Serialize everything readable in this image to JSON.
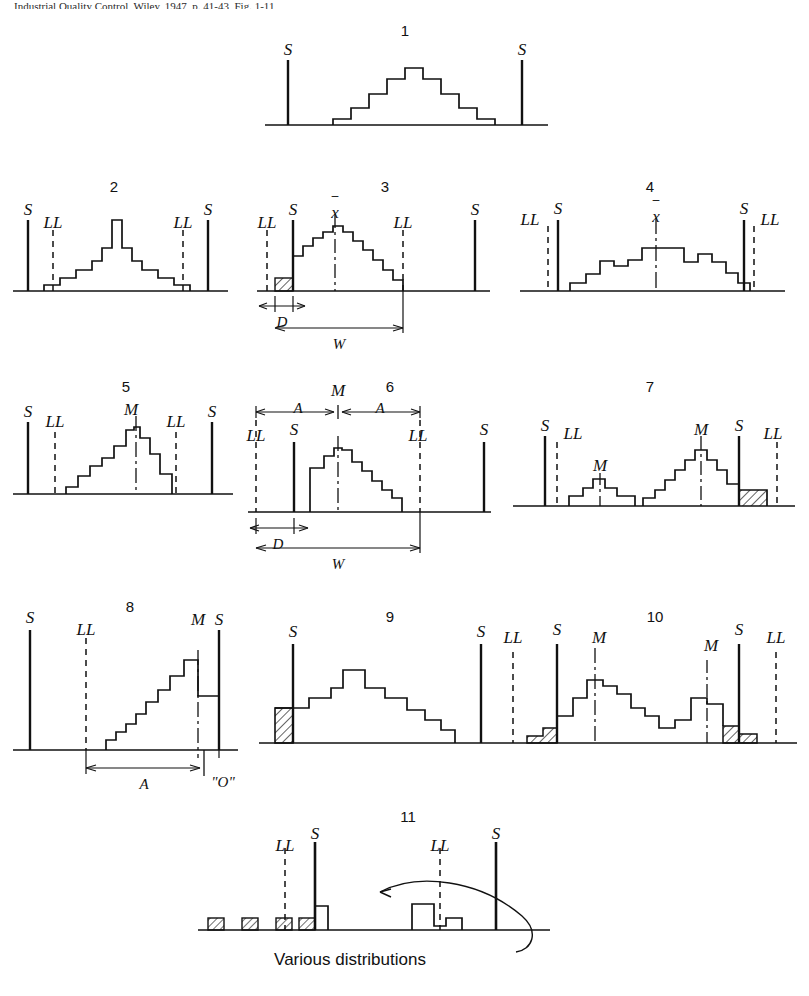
{
  "header": {
    "running_text": "Industrial Quality Control, Wiley, 1947, p. 41-43, Fig. 1-11"
  },
  "caption": {
    "various": "Various distributions"
  },
  "symbols": {
    "spec": "S",
    "limit": "LL",
    "xbarbar": "x",
    "mode": "M",
    "dim_a": "A",
    "dim_d": "D",
    "dim_w": "W",
    "zero": "\"O\""
  },
  "figures": [
    {
      "number": "1",
      "labels": [
        "S",
        "S"
      ],
      "annotations": [],
      "bars": [
        1,
        2,
        3,
        4,
        6,
        7,
        6,
        5,
        4,
        3,
        2,
        1
      ],
      "hatched": [],
      "note": "symmetric bell inside both spec limits"
    },
    {
      "number": "2",
      "labels": [
        "S",
        "LL",
        "LL",
        "S"
      ],
      "annotations": [],
      "bars": [
        1,
        1,
        2,
        3,
        4,
        5,
        9,
        5,
        4,
        3,
        2,
        1,
        1
      ],
      "hatched": [],
      "note": "narrow peak, tails reach LL lines"
    },
    {
      "number": "3",
      "labels": [
        "LL",
        "S",
        "x",
        "LL",
        "S"
      ],
      "annotations": [
        "D",
        "W"
      ],
      "bars": [
        1,
        2,
        5,
        6,
        7,
        8,
        7,
        6,
        5,
        4,
        3,
        2,
        1
      ],
      "hatched": [
        1
      ],
      "note": "shifted left, spill beyond left S, xbarbar centre"
    },
    {
      "number": "4",
      "labels": [
        "LL",
        "S",
        "x",
        "S",
        "LL"
      ],
      "annotations": [],
      "bars": [
        1,
        2,
        3,
        4,
        4,
        5,
        6,
        6,
        4,
        5,
        5,
        4,
        3,
        2,
        1
      ],
      "hatched": [],
      "note": "flat wide distribution well inside spec"
    },
    {
      "number": "5",
      "labels": [
        "S",
        "LL",
        "M",
        "LL",
        "S"
      ],
      "annotations": [],
      "bars": [
        1,
        2,
        3,
        4,
        5,
        6,
        7,
        8,
        7,
        5,
        4,
        2
      ],
      "hatched": [],
      "note": "peak at mode M inside LL limits"
    },
    {
      "number": "6",
      "labels": [
        "LL",
        "S",
        "M",
        "LL",
        "S"
      ],
      "annotations": [
        "A",
        "A",
        "D",
        "W"
      ],
      "bars": [
        5,
        6,
        8,
        9,
        8,
        7,
        6,
        5,
        4,
        3,
        2
      ],
      "hatched": [],
      "note": "skewed right, mode near left S"
    },
    {
      "number": "7",
      "labels": [
        "S",
        "LL",
        "M",
        "M",
        "S",
        "LL"
      ],
      "annotations": [],
      "bars": [
        1,
        2,
        3,
        3,
        2,
        1,
        0,
        1,
        2,
        3,
        4,
        5,
        6,
        7,
        6,
        5,
        4,
        2,
        2
      ],
      "hatched": [
        2
      ],
      "note": "bimodal, right mode spills past right S"
    },
    {
      "number": "8",
      "labels": [
        "S",
        "LL",
        "M",
        "S"
      ],
      "annotations": [
        "A",
        "\"O\""
      ],
      "bars": [
        1,
        2,
        3,
        4,
        5,
        6,
        7,
        8,
        9,
        6
      ],
      "hatched": [],
      "note": "ramp rising to right spec limit"
    },
    {
      "number": "9",
      "labels": [
        "S",
        "S"
      ],
      "annotations": [],
      "bars": [
        4,
        4,
        5,
        6,
        8,
        6,
        6,
        5,
        4,
        3,
        2
      ],
      "hatched": [
        4
      ],
      "note": "hatched block outside left S"
    },
    {
      "number": "10",
      "labels": [
        "LL",
        "S",
        "M",
        "M",
        "S",
        "LL"
      ],
      "annotations": [],
      "bars": [
        1,
        2,
        3,
        5,
        7,
        6,
        5,
        4,
        3,
        2,
        1,
        2,
        4,
        5,
        3,
        3,
        1
      ],
      "hatched": [
        1,
        2
      ],
      "note": "bimodal with hatched spill at both spec limits"
    },
    {
      "number": "11",
      "labels": [
        "LL",
        "S",
        "LL",
        "S"
      ],
      "annotations": [],
      "bars": [
        1,
        1,
        1,
        2
      ],
      "hatched": [
        3
      ],
      "note": "scattered small groups, arrow to Various distributions"
    }
  ]
}
